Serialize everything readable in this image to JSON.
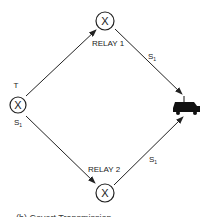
{
  "diagram": {
    "nodes": {
      "transmitter": {
        "symbol": "X",
        "top_label": "T",
        "bottom_label": "S",
        "bottom_sub": "1"
      },
      "relay1": {
        "symbol": "X",
        "label": "RELAY 1"
      },
      "relay2": {
        "symbol": "X",
        "label": "RELAY 2"
      },
      "receiver": {
        "icon": "vehicle-icon"
      }
    },
    "edges": [
      {
        "from": "transmitter",
        "to": "relay1",
        "label": ""
      },
      {
        "from": "relay1",
        "to": "receiver",
        "label": "S",
        "sub": "1"
      },
      {
        "from": "transmitter",
        "to": "relay2",
        "label": ""
      },
      {
        "from": "relay2",
        "to": "receiver",
        "label": "S",
        "sub": "1"
      }
    ],
    "caption": "(b) Covert Transmission"
  }
}
